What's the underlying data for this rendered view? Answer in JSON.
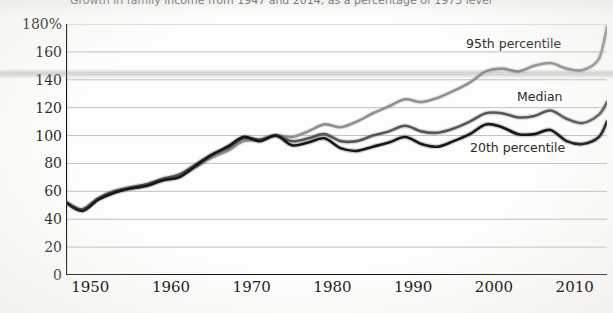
{
  "chart_data": {
    "type": "line",
    "title": "Growth in family income from 1947 and 2014, as a percentage of 1973 level",
    "xlabel": "",
    "ylabel": "",
    "ylim": [
      0,
      180
    ],
    "ytick_labels": [
      "180%",
      "160",
      "140",
      "120",
      "100",
      "80",
      "60",
      "40",
      "20",
      "0"
    ],
    "ytick_values": [
      180,
      160,
      140,
      120,
      100,
      80,
      60,
      40,
      20,
      0
    ],
    "xlim": [
      1947,
      2014
    ],
    "xtick_labels": [
      "1950",
      "1960",
      "1970",
      "1980",
      "1990",
      "2000",
      "2010"
    ],
    "xtick_values": [
      1950,
      1960,
      1970,
      1980,
      1990,
      2000,
      2010
    ],
    "grid": true,
    "legend_position": "inline-annotations",
    "series": [
      {
        "name": "95th percentile",
        "color": "#8f8f8f",
        "x": [
          1947,
          1949,
          1951,
          1953,
          1955,
          1957,
          1959,
          1961,
          1963,
          1965,
          1967,
          1969,
          1971,
          1973,
          1975,
          1977,
          1979,
          1981,
          1983,
          1985,
          1987,
          1989,
          1991,
          1993,
          1995,
          1997,
          1999,
          2001,
          2003,
          2005,
          2007,
          2009,
          2011,
          2013,
          2014
        ],
        "values": [
          52,
          47,
          55,
          60,
          62,
          64,
          68,
          71,
          77,
          84,
          89,
          96,
          97,
          100,
          99,
          103,
          108,
          106,
          110,
          116,
          121,
          126,
          124,
          127,
          132,
          138,
          146,
          148,
          146,
          150,
          152,
          148,
          147,
          155,
          178
        ]
      },
      {
        "name": "Median",
        "color": "#565656",
        "x": [
          1947,
          1949,
          1951,
          1953,
          1955,
          1957,
          1959,
          1961,
          1963,
          1965,
          1967,
          1969,
          1971,
          1973,
          1975,
          1977,
          1979,
          1981,
          1983,
          1985,
          1987,
          1989,
          1991,
          1993,
          1995,
          1997,
          1999,
          2001,
          2003,
          2005,
          2007,
          2009,
          2011,
          2013,
          2014
        ],
        "values": [
          52,
          47,
          55,
          60,
          63,
          65,
          69,
          72,
          79,
          86,
          91,
          98,
          97,
          100,
          96,
          98,
          101,
          96,
          96,
          100,
          103,
          107,
          103,
          102,
          105,
          110,
          116,
          116,
          113,
          114,
          118,
          112,
          109,
          115,
          124
        ]
      },
      {
        "name": "20th percentile",
        "color": "#171717",
        "x": [
          1947,
          1949,
          1951,
          1953,
          1955,
          1957,
          1959,
          1961,
          1963,
          1965,
          1967,
          1969,
          1971,
          1973,
          1975,
          1977,
          1979,
          1981,
          1983,
          1985,
          1987,
          1989,
          1991,
          1993,
          1995,
          1997,
          1999,
          2001,
          2003,
          2005,
          2007,
          2009,
          2011,
          2013,
          2014
        ],
        "values": [
          52,
          46,
          54,
          59,
          62,
          64,
          68,
          70,
          78,
          86,
          92,
          99,
          96,
          100,
          93,
          95,
          98,
          91,
          89,
          92,
          95,
          99,
          94,
          92,
          96,
          101,
          108,
          106,
          101,
          101,
          104,
          96,
          94,
          99,
          110
        ]
      }
    ]
  },
  "annotations": {
    "series_95_label": "95th percentile",
    "series_median_label": "Median",
    "series_20_label": "20th percentile"
  }
}
